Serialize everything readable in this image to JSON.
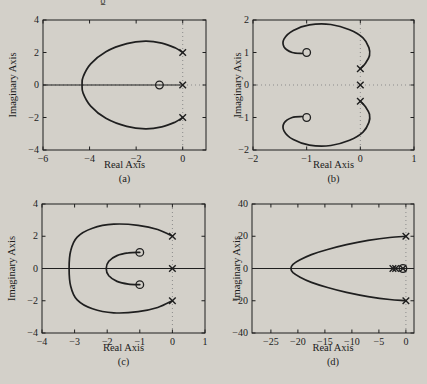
{
  "figure": {
    "background": "#d3d0c9",
    "ink": "#1f1f1f",
    "dotted_color": "#8b8b8b",
    "top_remnant": "g"
  },
  "chart_data": [
    {
      "id": "a",
      "type": "line",
      "xlabel": "Real Axis",
      "ylabel": "Imaginary Axis",
      "sublabel": "(a)",
      "xlim": [
        -6,
        1
      ],
      "ylim": [
        -4,
        4
      ],
      "xtick_vals": [
        -6,
        -4,
        -2,
        0
      ],
      "xtick_labels": [
        "−6",
        "−4",
        "−2",
        "0"
      ],
      "ytick_vals": [
        -4,
        -2,
        0,
        2,
        4
      ],
      "ytick_labels": [
        "−4",
        "−2",
        "0",
        "2",
        "4"
      ],
      "dotted_vlines": [
        0
      ],
      "dotted_hlines": [
        0
      ],
      "real_axis_segment": [
        -6,
        0
      ],
      "poles": [
        [
          0,
          2
        ],
        [
          0,
          0
        ],
        [
          0,
          -2
        ]
      ],
      "zeros": [
        [
          -1,
          0
        ]
      ],
      "branches": [
        [
          [
            0,
            2
          ],
          [
            -0.35,
            2.3
          ],
          [
            -0.9,
            2.58
          ],
          [
            -1.6,
            2.7
          ],
          [
            -2.4,
            2.55
          ],
          [
            -3.3,
            2.05
          ],
          [
            -3.95,
            1.3
          ],
          [
            -4.28,
            0.5
          ],
          [
            -4.32,
            0
          ],
          [
            -4.28,
            -0.5
          ],
          [
            -3.95,
            -1.3
          ],
          [
            -3.3,
            -2.05
          ],
          [
            -2.4,
            -2.55
          ],
          [
            -1.6,
            -2.7
          ],
          [
            -0.9,
            -2.58
          ],
          [
            -0.35,
            -2.3
          ],
          [
            0,
            -2
          ]
        ]
      ]
    },
    {
      "id": "b",
      "type": "line",
      "xlabel": "Real Axis",
      "ylabel": "Imaginary Axis",
      "sublabel": "(b)",
      "xlim": [
        -2,
        1
      ],
      "ylim": [
        -2,
        2
      ],
      "xtick_vals": [
        -2,
        -1,
        0,
        1
      ],
      "xtick_labels": [
        "−2",
        "−1",
        "0",
        "1"
      ],
      "ytick_vals": [
        -2,
        -1,
        0,
        1,
        2
      ],
      "ytick_labels": [
        "−2",
        "−1",
        "0",
        "1",
        "2"
      ],
      "dotted_vlines": [
        0
      ],
      "dotted_hlines": [
        0
      ],
      "real_axis_segment": null,
      "poles": [
        [
          0,
          0.5
        ],
        [
          0,
          0
        ],
        [
          0,
          -0.5
        ]
      ],
      "zeros": [
        [
          -1,
          1
        ],
        [
          -1,
          -1
        ]
      ],
      "branches": [
        [
          [
            0,
            0.5
          ],
          [
            0.1,
            0.68
          ],
          [
            0.17,
            0.9
          ],
          [
            0.16,
            1.15
          ],
          [
            0.05,
            1.45
          ],
          [
            -0.2,
            1.7
          ],
          [
            -0.55,
            1.86
          ],
          [
            -0.95,
            1.85
          ],
          [
            -1.25,
            1.68
          ],
          [
            -1.42,
            1.42
          ],
          [
            -1.42,
            1.17
          ],
          [
            -1.27,
            1.0
          ],
          [
            -1.08,
            0.97
          ]
        ],
        [
          [
            0,
            -0.5
          ],
          [
            0.1,
            -0.68
          ],
          [
            0.17,
            -0.9
          ],
          [
            0.16,
            -1.15
          ],
          [
            0.05,
            -1.45
          ],
          [
            -0.2,
            -1.7
          ],
          [
            -0.55,
            -1.86
          ],
          [
            -0.95,
            -1.85
          ],
          [
            -1.25,
            -1.68
          ],
          [
            -1.42,
            -1.42
          ],
          [
            -1.42,
            -1.17
          ],
          [
            -1.27,
            -1.0
          ],
          [
            -1.08,
            -0.97
          ]
        ]
      ]
    },
    {
      "id": "c",
      "type": "line",
      "xlabel": "Real Axis",
      "ylabel": "Imaginary Axis",
      "sublabel": "(c)",
      "xlim": [
        -4,
        1
      ],
      "ylim": [
        -4,
        4
      ],
      "xtick_vals": [
        -4,
        -3,
        -2,
        -1,
        0,
        1
      ],
      "xtick_labels": [
        "−4",
        "−3",
        "−2",
        "−1",
        "0",
        "1"
      ],
      "ytick_vals": [
        -4,
        -2,
        0,
        2,
        4
      ],
      "ytick_labels": [
        "−4",
        "−2",
        "0",
        "2",
        "4"
      ],
      "dotted_vlines": [
        0
      ],
      "dotted_hlines": [],
      "real_axis_segment": [
        -4,
        1
      ],
      "poles": [
        [
          0,
          2
        ],
        [
          0,
          0
        ],
        [
          0,
          -2
        ]
      ],
      "zeros": [
        [
          -1,
          1
        ],
        [
          -1,
          -1
        ]
      ],
      "branches": [
        [
          [
            0,
            2
          ],
          [
            -0.45,
            2.42
          ],
          [
            -1.05,
            2.68
          ],
          [
            -1.8,
            2.75
          ],
          [
            -2.45,
            2.5
          ],
          [
            -2.92,
            1.95
          ],
          [
            -3.12,
            1.1
          ],
          [
            -3.17,
            0
          ],
          [
            -3.12,
            -1.1
          ],
          [
            -2.92,
            -1.95
          ],
          [
            -2.45,
            -2.5
          ],
          [
            -1.8,
            -2.75
          ],
          [
            -1.05,
            -2.68
          ],
          [
            -0.45,
            -2.42
          ],
          [
            0,
            -2
          ]
        ],
        [
          [
            -1,
            1
          ],
          [
            -1.35,
            0.97
          ],
          [
            -1.7,
            0.8
          ],
          [
            -1.95,
            0.45
          ],
          [
            -2.03,
            0
          ],
          [
            -1.95,
            -0.45
          ],
          [
            -1.7,
            -0.8
          ],
          [
            -1.35,
            -0.97
          ],
          [
            -1,
            -1
          ]
        ]
      ]
    },
    {
      "id": "d",
      "type": "line",
      "xlabel": "Real Axis",
      "ylabel": "Imaginary Axis",
      "sublabel": "(d)",
      "xlim": [
        -28.5,
        1.5
      ],
      "ylim": [
        -40,
        40
      ],
      "xtick_vals": [
        -25,
        -20,
        -15,
        -10,
        -5,
        0
      ],
      "xtick_labels": [
        "−25",
        "−20",
        "−15",
        "−10",
        "−5",
        "0"
      ],
      "ytick_vals": [
        -40,
        -20,
        0,
        20,
        40
      ],
      "ytick_labels": [
        "−40",
        "−20",
        "0",
        "20",
        "40"
      ],
      "dotted_vlines": [
        0
      ],
      "dotted_hlines": [],
      "real_axis_segment": [
        -28.5,
        1.5
      ],
      "poles": [
        [
          0,
          20
        ],
        [
          0,
          -20
        ],
        [
          -2.4,
          0
        ],
        [
          -1.9,
          0
        ],
        [
          -0.55,
          0
        ]
      ],
      "zeros": [
        [
          -0.55,
          0
        ]
      ],
      "branches": [
        [
          [
            0,
            20
          ],
          [
            -3,
            19.2
          ],
          [
            -7,
            17.4
          ],
          [
            -11,
            14.8
          ],
          [
            -14.5,
            11.8
          ],
          [
            -17.5,
            8.6
          ],
          [
            -19.6,
            5.4
          ],
          [
            -20.9,
            2.6
          ],
          [
            -21.3,
            0
          ],
          [
            -20.9,
            -2.6
          ],
          [
            -19.6,
            -5.4
          ],
          [
            -17.5,
            -8.6
          ],
          [
            -14.5,
            -11.8
          ],
          [
            -11,
            -14.8
          ],
          [
            -7,
            -17.4
          ],
          [
            -3,
            -19.2
          ],
          [
            0,
            -20
          ]
        ]
      ]
    }
  ]
}
